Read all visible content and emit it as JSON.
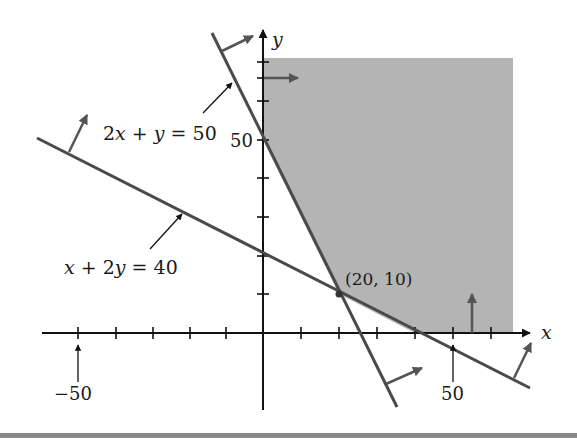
{
  "figure": {
    "type": "linear-programming-feasible-region",
    "axes": {
      "x_label": "x",
      "y_label": "y",
      "x_tick_step": 10,
      "y_tick_step": 10,
      "x_labeled_ticks": [
        {
          "value": -50,
          "label": "−50"
        },
        {
          "value": 50,
          "label": "50"
        }
      ],
      "y_labeled_ticks": [
        {
          "value": 50,
          "label": "50"
        }
      ]
    },
    "constraints": [
      {
        "equation": "2x + y = 50",
        "label_parts": [
          "2",
          "x",
          " + ",
          "y",
          " = 50"
        ],
        "feasible_side": "above-right"
      },
      {
        "equation": "x + 2y = 40",
        "label_parts": [
          "x",
          " + 2",
          "y",
          " = 40"
        ],
        "feasible_side": "above-right"
      },
      {
        "equation": "x = 0",
        "feasible_side": "right"
      },
      {
        "equation": "y = 0",
        "feasible_side": "above"
      }
    ],
    "vertex": {
      "label": "(20, 10)",
      "x": 20,
      "y": 10
    },
    "labels": {
      "line1_a": "2",
      "line1_b": "x",
      "line1_c": " + ",
      "line1_d": "y",
      "line1_e": " = 50",
      "line2_a": "x",
      "line2_b": " + 2",
      "line2_c": "y",
      "line2_d": " = 40",
      "x_axis": "x",
      "y_axis": "y",
      "tick_neg50": "−50",
      "tick_pos50": "50",
      "tick_y50": "50",
      "vertex": "(20, 10)"
    },
    "colors": {
      "shade": "#b4b4b4",
      "constraint_line": "#4a4a4a",
      "axis": "#111111",
      "arrow": "#505050"
    }
  }
}
